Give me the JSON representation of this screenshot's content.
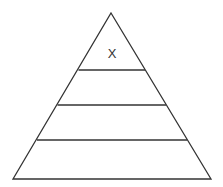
{
  "diagram": {
    "type": "pyramid",
    "levels": 4,
    "label": "X",
    "stroke_color": "#333333",
    "background": "#ffffff"
  }
}
